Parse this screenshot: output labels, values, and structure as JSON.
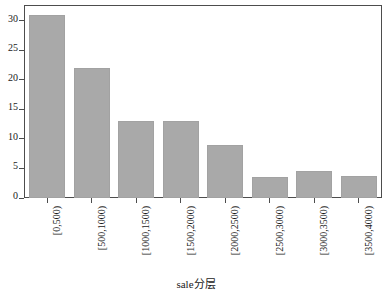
{
  "chart_data": {
    "type": "bar",
    "title": "",
    "xlabel": "sale分层",
    "ylabel": "",
    "categories": [
      "[0,500)",
      "[500,1000)",
      "[1000,1500)",
      "[1500,2000)",
      "[2000,2500)",
      "[2500,3000)",
      "[3000,3500)",
      "[3500,4000)"
    ],
    "values": [
      31,
      22,
      13,
      13,
      9,
      3.5,
      4.5,
      3.7
    ],
    "yticks": [
      0,
      5,
      10,
      15,
      20,
      25,
      30
    ],
    "ylim": [
      0,
      32.5
    ],
    "xlim": [
      0,
      8
    ],
    "grid": false,
    "legend": null,
    "bar_color": "#a9a9a9",
    "frame_color": "#4d4d4d",
    "background": "#ffffff"
  }
}
